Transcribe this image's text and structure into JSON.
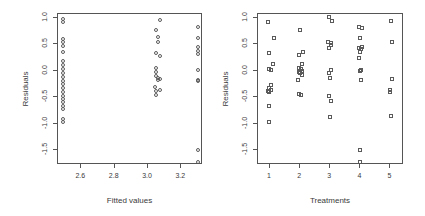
{
  "figure": {
    "background": "#ffffff",
    "marker_color": "#5a5a5a",
    "axis_color": "#555555",
    "text_color": "#3a3a3a"
  },
  "chart_data": [
    {
      "type": "scatter",
      "panel": "left",
      "title": "",
      "xlabel": "Fitted values",
      "ylabel": "Residuals",
      "marker": "circle",
      "grid": false,
      "legend": "none",
      "xlim": [
        2.46,
        3.33
      ],
      "ylim": [
        -1.78,
        1.07
      ],
      "xticks": [
        2.6,
        2.8,
        3.0,
        3.2
      ],
      "xtick_labels": [
        "2.6",
        "2.8",
        "3.0",
        "3.2"
      ],
      "yticks": [
        1.0,
        0.5,
        0.0,
        -0.5,
        -1.0,
        -1.5
      ],
      "ytick_labels": [
        "1.0",
        "0.5",
        "0.0",
        "-0.5",
        "-1.0",
        "-1.5"
      ],
      "x": [
        2.49,
        2.49,
        2.49,
        2.49,
        2.49,
        2.49,
        2.49,
        2.49,
        2.49,
        2.49,
        2.49,
        2.49,
        2.49,
        2.49,
        2.49,
        2.49,
        2.49,
        2.49,
        2.49,
        2.49,
        2.49,
        2.49,
        3.07,
        3.05,
        3.06,
        3.06,
        3.05,
        3.07,
        3.05,
        3.05,
        3.05,
        3.06,
        3.07,
        3.06,
        3.04,
        3.05,
        3.07,
        3.05,
        3.3,
        3.3,
        3.3,
        3.3,
        3.3,
        3.3,
        3.3,
        3.3,
        3.3,
        3.3
      ],
      "y": [
        0.98,
        0.92,
        0.6,
        0.55,
        0.46,
        0.36,
        0.18,
        0.1,
        0.03,
        -0.05,
        -0.12,
        -0.19,
        -0.26,
        -0.33,
        -0.4,
        -0.47,
        -0.54,
        -0.6,
        -0.66,
        -0.72,
        -0.92,
        -0.97,
        0.95,
        0.76,
        0.64,
        0.54,
        0.34,
        0.28,
        0.06,
        -0.02,
        -0.1,
        -0.14,
        -0.16,
        -0.18,
        -0.3,
        -0.38,
        -0.37,
        -0.45,
        0.82,
        0.62,
        0.45,
        0.38,
        0.32,
        0.02,
        -0.18,
        -0.2,
        -1.5,
        -1.72
      ]
    },
    {
      "type": "scatter",
      "panel": "right",
      "title": "",
      "xlabel": "Treatments",
      "ylabel": "Residuals",
      "marker": "square",
      "grid": false,
      "legend": "none",
      "xlim": [
        0.6,
        5.45
      ],
      "ylim": [
        -1.78,
        1.07
      ],
      "xticks": [
        1,
        2,
        3,
        4,
        5
      ],
      "xtick_labels": [
        "1",
        "2",
        "3",
        "4",
        "5"
      ],
      "yticks": [
        1.0,
        0.5,
        0.0,
        -0.5,
        -1.0,
        -1.5
      ],
      "ytick_labels": [
        "1.0",
        "0.5",
        "0.0",
        "-0.5",
        "-1.0",
        "-1.5"
      ],
      "x": [
        0.93,
        1.12,
        0.98,
        1.1,
        0.95,
        1.02,
        1.03,
        0.95,
        1.04,
        0.93,
        0.96,
        0.95,
        0.96,
        1.98,
        2.1,
        1.95,
        2.05,
        1.95,
        2.02,
        2.06,
        1.96,
        2.0,
        2.05,
        1.92,
        1.97,
        2.03,
        2.95,
        3.05,
        2.93,
        3.03,
        3.02,
        2.95,
        3.04,
        2.96,
        3.0,
        2.97,
        3.02,
        2.98,
        3.95,
        4.05,
        3.98,
        4.06,
        3.96,
        4.02,
        4.0,
        3.97,
        4.03,
        3.98,
        4.02,
        3.99,
        4.0,
        5.02,
        5.05,
        5.06,
        5.0,
        4.97,
        5.03
      ],
      "y": [
        0.92,
        0.62,
        0.33,
        0.13,
        0.03,
        0.02,
        -0.27,
        -0.33,
        -0.36,
        -0.38,
        -0.4,
        -0.67,
        -0.97,
        0.76,
        0.36,
        0.3,
        0.12,
        0.06,
        0.04,
        0.0,
        -0.03,
        -0.05,
        -0.08,
        -0.18,
        -0.44,
        -0.46,
        1.02,
        0.93,
        0.54,
        0.52,
        0.48,
        0.42,
        0.02,
        -0.04,
        -0.14,
        -0.48,
        -0.57,
        -0.87,
        0.82,
        0.8,
        0.62,
        0.44,
        0.42,
        0.4,
        0.36,
        0.24,
        0.02,
        0.0,
        -0.18,
        -1.5,
        -1.72,
        0.94,
        0.54,
        -0.16,
        -0.36,
        -0.4,
        -0.86
      ]
    }
  ]
}
